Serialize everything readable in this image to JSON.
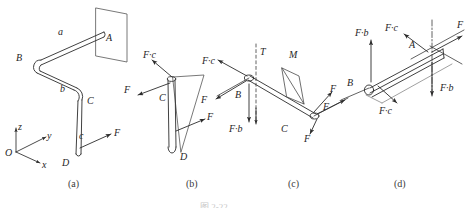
{
  "figure": {
    "caption": "图 2-22",
    "panels": [
      {
        "id": "a",
        "label": "(a)",
        "x": 68,
        "y": 180
      },
      {
        "id": "b",
        "label": "(b)",
        "x": 186,
        "y": 180
      },
      {
        "id": "c",
        "label": "(c)",
        "x": 288,
        "y": 180
      },
      {
        "id": "d",
        "label": "(d)",
        "x": 394,
        "y": 180
      }
    ]
  },
  "axes": {
    "origin_label": "O",
    "z_label": "z",
    "y_label": "y",
    "x_label": "x"
  },
  "panel_a": {
    "labels": [
      {
        "text": "a",
        "x": 58,
        "y": 27,
        "italic": true
      },
      {
        "text": "A",
        "x": 106,
        "y": 33,
        "italic": true
      },
      {
        "text": "B",
        "x": 16,
        "y": 53,
        "italic": true
      },
      {
        "text": "b",
        "x": 60,
        "y": 84,
        "italic": true
      },
      {
        "text": "C",
        "x": 87,
        "y": 96,
        "italic": true
      },
      {
        "text": "c",
        "x": 79,
        "y": 131,
        "italic": true
      },
      {
        "text": "F",
        "x": 114,
        "y": 133,
        "italic": true
      },
      {
        "text": "D",
        "x": 62,
        "y": 164,
        "italic": true
      }
    ]
  },
  "panel_b": {
    "labels": [
      {
        "text": "F·c",
        "x": 143,
        "y": 52,
        "italic": true
      },
      {
        "text": "F",
        "x": 124,
        "y": 87,
        "italic": true
      },
      {
        "text": "C",
        "x": 159,
        "y": 95,
        "italic": true
      },
      {
        "text": "F",
        "x": 207,
        "y": 115,
        "italic": true
      },
      {
        "text": "D",
        "x": 180,
        "y": 161,
        "italic": true
      }
    ]
  },
  "panel_c": {
    "labels": [
      {
        "text": "F·c",
        "x": 204,
        "y": 70,
        "italic": true
      },
      {
        "text": "T",
        "x": 260,
        "y": 53,
        "italic": true
      },
      {
        "text": "M",
        "x": 289,
        "y": 56,
        "italic": true
      },
      {
        "text": "B",
        "x": 235,
        "y": 92,
        "italic": true
      },
      {
        "text": "F",
        "x": 201,
        "y": 97,
        "italic": true
      },
      {
        "text": "F·b",
        "x": 232,
        "y": 128,
        "italic": true
      },
      {
        "text": "C",
        "x": 281,
        "y": 124,
        "italic": true
      },
      {
        "text": "F",
        "x": 325,
        "y": 85,
        "italic": true
      },
      {
        "text": "F",
        "x": 316,
        "y": 105,
        "italic": true
      },
      {
        "text": "F",
        "x": 304,
        "y": 137,
        "italic": true
      }
    ]
  },
  "panel_d": {
    "labels": [
      {
        "text": "F·b",
        "x": 355,
        "y": 30,
        "italic": true
      },
      {
        "text": "F·c",
        "x": 387,
        "y": 27,
        "italic": true
      },
      {
        "text": "A",
        "x": 409,
        "y": 45,
        "italic": true
      },
      {
        "text": "F",
        "x": 458,
        "y": 24,
        "italic": true
      },
      {
        "text": "B",
        "x": 347,
        "y": 76,
        "italic": true
      },
      {
        "text": "F·b",
        "x": 442,
        "y": 86,
        "italic": true
      },
      {
        "text": "F·c",
        "x": 380,
        "y": 106,
        "italic": true
      }
    ]
  },
  "colors": {
    "stroke": "#2b2b2b",
    "light_stroke": "#6e6e6e",
    "background": "#ffffff",
    "text": "#262626"
  }
}
